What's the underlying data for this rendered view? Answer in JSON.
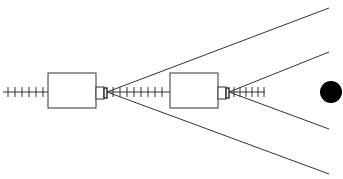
{
  "diagram": {
    "width": 343,
    "height": 179,
    "stroke_color": "#333333",
    "fill_color": "#000000",
    "background": "#ffffff",
    "axis_y": 92,
    "elements": {
      "left_track": {
        "x1": 3,
        "x2": 48,
        "ticks": [
          8,
          15,
          22,
          29,
          36,
          43
        ]
      },
      "box_1": {
        "x": 48,
        "y": 73,
        "w": 48,
        "h": 35
      },
      "nozzle_1": {
        "x": 96,
        "y": 87,
        "w": 8,
        "h": 12,
        "lens_x": 104,
        "lens_w": 3
      },
      "cone_1": {
        "apex_x": 107,
        "end_x": 329,
        "top_y": 8,
        "bottom_y": 174
      },
      "mid_track": {
        "x1": 108,
        "x2": 170,
        "ticks": [
          113,
          120,
          127,
          134,
          141,
          148,
          155,
          162
        ]
      },
      "box_2": {
        "x": 170,
        "y": 73,
        "w": 48,
        "h": 35
      },
      "nozzle_2": {
        "x": 218,
        "y": 87,
        "w": 8,
        "h": 12,
        "lens_x": 226,
        "lens_w": 3
      },
      "cone_2": {
        "apex_x": 229,
        "end_x": 329,
        "top_y": 52,
        "bottom_y": 129
      },
      "right_track": {
        "x1": 230,
        "x2": 265,
        "ticks": [
          234,
          240,
          246,
          252,
          258,
          264
        ]
      },
      "target_dot": {
        "cx": 331,
        "cy": 92,
        "r": 11
      }
    }
  }
}
